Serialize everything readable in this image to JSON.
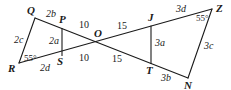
{
  "diagram": {
    "type": "similar-triangles-geometry",
    "vertices": {
      "Q": "Q",
      "P": "P",
      "R": "R",
      "S": "S",
      "O": "O",
      "J": "J",
      "T": "T",
      "Z": "Z",
      "N": "N"
    },
    "segment_labels": {
      "QP": "2b",
      "QR": "2c",
      "PS": "2a",
      "RS": "2d",
      "PO": "10",
      "SO": "10",
      "OJ": "15",
      "OT": "15",
      "JT": "3a",
      "JZ": "3d",
      "ZN": "3c",
      "TN": "3b"
    },
    "angles": {
      "R": "55°",
      "Z": "55°"
    }
  }
}
